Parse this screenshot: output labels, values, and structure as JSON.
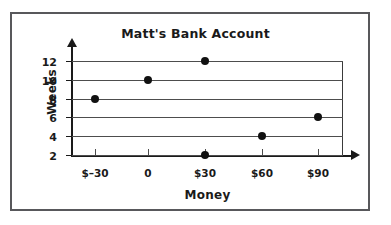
{
  "frame": {
    "border_color": "#58585b"
  },
  "chart_data": {
    "type": "scatter",
    "title": "Matt's Bank Account",
    "xlabel": "Money",
    "ylabel": "Weeks",
    "x": [
      -30,
      0,
      30,
      30,
      60,
      90
    ],
    "y": [
      8,
      10,
      12,
      2,
      4,
      6
    ],
    "points": [
      {
        "x": -30,
        "y": 8
      },
      {
        "x": 0,
        "y": 10
      },
      {
        "x": 30,
        "y": 12
      },
      {
        "x": 30,
        "y": 2
      },
      {
        "x": 60,
        "y": 4
      },
      {
        "x": 90,
        "y": 6
      }
    ],
    "xticks": [
      -30,
      0,
      30,
      60,
      90
    ],
    "xtick_labels": [
      "$–30",
      "0",
      "$30",
      "$60",
      "$90"
    ],
    "yticks": [
      2,
      4,
      6,
      8,
      10,
      12
    ],
    "ytick_labels": [
      "2",
      "4",
      "6",
      "8",
      "10",
      "12"
    ],
    "xlim": [
      -45,
      105
    ],
    "ylim": [
      2,
      12
    ],
    "grid": "horizontal",
    "legend": "none",
    "point_color": "#111111",
    "gridline_color": "#4d4d4d",
    "axis_color": "#1a1a1a"
  }
}
